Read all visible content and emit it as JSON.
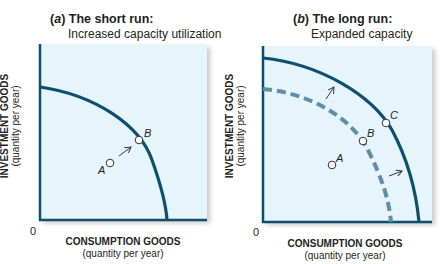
{
  "colors": {
    "panel_bg": "#e6f4fb",
    "curve": "#0d4f6e",
    "dashed_curve": "#5e8ea8",
    "axis": "#0d4f6e",
    "text": "#231f20"
  },
  "panels": [
    {
      "letter": "a",
      "title": "The short run:",
      "subtitle": "Increased capacity utilization",
      "y_axis": {
        "label": "INVESTMENT GOODS",
        "sub": "(quantity per year)"
      },
      "x_axis": {
        "label": "CONSUMPTION GOODS",
        "sub": "(quantity per year)"
      },
      "origin": "0",
      "points": [
        {
          "name": "A",
          "description": "inside frontier"
        },
        {
          "name": "B",
          "description": "on frontier"
        }
      ]
    },
    {
      "letter": "b",
      "title": "The long run:",
      "subtitle": "Expanded capacity",
      "y_axis": {
        "label": "INVESTMENT GOODS",
        "sub": "(quantity per year)"
      },
      "x_axis": {
        "label": "CONSUMPTION GOODS",
        "sub": "(quantity per year)"
      },
      "origin": "0",
      "points": [
        {
          "name": "A",
          "description": "inside original frontier"
        },
        {
          "name": "B",
          "description": "on original (dashed) frontier"
        },
        {
          "name": "C",
          "description": "on expanded frontier"
        }
      ]
    }
  ]
}
